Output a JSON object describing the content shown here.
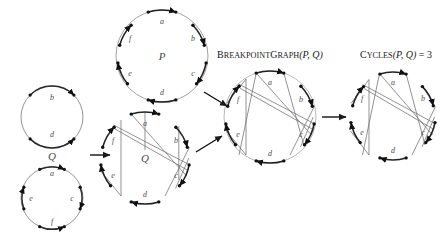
{
  "figure": {
    "type": "breakpoint-graph-construction",
    "background": "#ffffff",
    "stroke_color": "#3c3c3c",
    "label_color": "#4a4a4a",
    "caption_color": "#1a1a1a",
    "node_color": "#111111"
  },
  "panels": [
    {
      "id": "genome-q-split",
      "kind": "two-circles",
      "center_label": "Q",
      "circles": [
        {
          "id": "q-top",
          "cx": 52,
          "cy": 117,
          "r": 31,
          "arcs": [
            "b",
            "d"
          ]
        },
        {
          "id": "q-bottom",
          "cx": 52,
          "cy": 198,
          "r": 31,
          "arcs": [
            "a",
            "c",
            "e",
            "f"
          ]
        }
      ]
    },
    {
      "id": "genome-p",
      "kind": "circle",
      "center_label": "P",
      "cx": 162,
      "cy": 56,
      "r": 46,
      "arcs": [
        "a",
        "b",
        "c",
        "d",
        "e",
        "f"
      ]
    },
    {
      "id": "genome-q-superimposed",
      "kind": "circle-chords",
      "center_label": "Q",
      "cx": 145,
      "cy": 158,
      "r": 46,
      "arcs": [
        "a",
        "b",
        "c",
        "d",
        "e",
        "f"
      ]
    },
    {
      "id": "breakpoint-graph",
      "kind": "circle-chords",
      "caption": "BreakpointGraph(P, Q)",
      "caption_parts": {
        "name": "BreakpointGraph",
        "args": "(P, Q)"
      },
      "cx": 270,
      "cy": 117,
      "r": 46,
      "arcs": [
        "a",
        "b",
        "c",
        "d",
        "e",
        "f"
      ]
    },
    {
      "id": "cycles",
      "kind": "chords-only",
      "caption": "Cycles(P, Q) = 3",
      "caption_parts": {
        "name": "Cycles",
        "args": "(P, Q) = 3"
      },
      "cx": 393,
      "cy": 117,
      "r": 44,
      "arcs": [
        "a",
        "b",
        "c",
        "d",
        "e",
        "f"
      ],
      "cycle_count": 3
    }
  ],
  "arrows": [
    {
      "id": "arrow-q-to-superimposed",
      "x1": 90,
      "y1": 155,
      "x2": 112,
      "y2": 155
    },
    {
      "id": "arrow-p-to-breakpoint",
      "x1": 203,
      "y1": 93,
      "x2": 229,
      "y2": 108
    },
    {
      "id": "arrow-sup-to-breakpoint",
      "x1": 195,
      "y1": 150,
      "x2": 224,
      "y2": 133
    },
    {
      "id": "arrow-breakpoint-to-cycles",
      "x1": 322,
      "y1": 117,
      "x2": 350,
      "y2": 117
    }
  ],
  "arc_labels": [
    "a",
    "b",
    "c",
    "d",
    "e",
    "f"
  ]
}
